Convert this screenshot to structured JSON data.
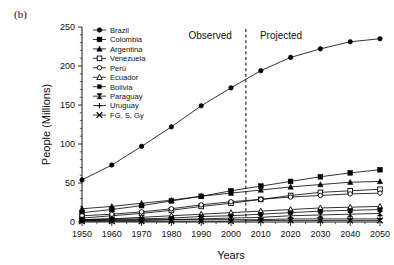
{
  "figure": {
    "panel_label": "(b)"
  },
  "annotations": {
    "observed": "Observed",
    "projected": "Projected",
    "divider_year": 2005
  },
  "chart_data": {
    "type": "line",
    "title": "",
    "xlabel": "Years",
    "ylabel": "People (Millions)",
    "x": [
      1950,
      1960,
      1970,
      1980,
      1990,
      2000,
      2010,
      2020,
      2030,
      2040,
      2050
    ],
    "xlim": [
      1950,
      2050
    ],
    "ylim": [
      0,
      250
    ],
    "yticks": [
      0,
      50,
      100,
      150,
      200,
      250
    ],
    "xticks": [
      "1950",
      "1960",
      "1970",
      "1980",
      "1990",
      "2000",
      "2010",
      "2020",
      "2030",
      "2040",
      "2050"
    ],
    "ytick_labels": [
      "0",
      "50",
      "100",
      "150",
      "200",
      "250"
    ],
    "grid": false,
    "legend_position": "upper-left-inside",
    "series": [
      {
        "name": "Brazil",
        "marker": "filled-circle",
        "values": [
          54,
          73,
          97,
          122,
          149,
          172,
          194,
          211,
          222,
          231,
          235
        ]
      },
      {
        "name": "Colombia",
        "marker": "filled-square",
        "values": [
          12,
          16,
          21,
          27,
          33,
          40,
          46,
          52,
          58,
          63,
          67
        ]
      },
      {
        "name": "Argentina",
        "marker": "filled-triangle",
        "values": [
          17,
          20,
          24,
          28,
          33,
          37,
          41,
          45,
          48,
          51,
          52
        ]
      },
      {
        "name": "Venezuela",
        "marker": "open-square",
        "values": [
          5,
          8,
          11,
          15,
          20,
          24,
          29,
          34,
          38,
          40,
          42
        ]
      },
      {
        "name": "Perú",
        "marker": "open-circle",
        "values": [
          8,
          10,
          13,
          17,
          22,
          26,
          29,
          32,
          34,
          36,
          37
        ]
      },
      {
        "name": "Ecuador",
        "marker": "open-triangle",
        "values": [
          3,
          4,
          6,
          8,
          10,
          12,
          14,
          16,
          18,
          19,
          20
        ]
      },
      {
        "name": "Bolivia",
        "marker": "small-filled-square",
        "values": [
          3,
          4,
          4,
          5,
          7,
          8,
          10,
          12,
          14,
          15,
          16
        ]
      },
      {
        "name": "Paraguay",
        "marker": "bowtie",
        "values": [
          2,
          2,
          2,
          3,
          4,
          5,
          6,
          8,
          9,
          10,
          11
        ]
      },
      {
        "name": "Uruguay",
        "marker": "plus",
        "values": [
          2,
          3,
          3,
          3,
          3,
          3,
          3,
          4,
          4,
          4,
          4
        ]
      },
      {
        "name": "FG, S, Gy",
        "marker": "cross-x",
        "values": [
          1,
          1,
          1,
          1,
          1,
          1,
          2,
          2,
          2,
          2,
          2
        ]
      }
    ]
  }
}
